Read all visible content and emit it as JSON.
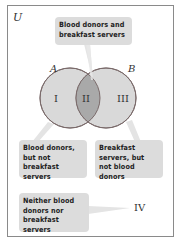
{
  "universe_label": "U",
  "sets": {
    "A": {
      "label": "A"
    },
    "B": {
      "label": "B"
    }
  },
  "regions": {
    "I": {
      "label": "I",
      "description": "Blood donors, but not breakfast servers"
    },
    "II": {
      "label": "II",
      "description": "Blood donors and breakfast servers"
    },
    "III": {
      "label": "III",
      "description": "Breakfast servers, but not blood donors"
    },
    "IV": {
      "label": "IV",
      "description": "Neither blood donors nor breakfast servers"
    }
  },
  "colors": {
    "circle_fill": "#d9d9d9",
    "intersection_fill": "#a9a9a9",
    "circle_stroke": "#7a6a6a",
    "callout_fill": "#dcdcdc",
    "frame_border": "#8a8a8a"
  }
}
